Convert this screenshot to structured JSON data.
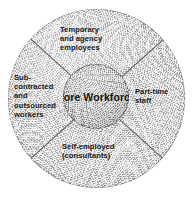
{
  "diagram": {
    "type": "core-periphery-workforce-donut",
    "title": "Core Workforce",
    "core": {
      "name": "core-circle",
      "lines": [
        "Core",
        "Workforce"
      ],
      "fill_color": "#c4c4c4",
      "border_color": "#2d2d2d"
    },
    "ring": {
      "fill_color": "#d6d6d6",
      "border_color": "#3c3c3c",
      "divider_color": "#373737",
      "divider_count": 4
    },
    "background_color": "#ffffff",
    "text_color": "#1a1a1a",
    "segments": [
      {
        "id": "temporary-and-agency-employees",
        "position": "top",
        "lines": [
          "Temporary",
          "and agency",
          "employees"
        ]
      },
      {
        "id": "sub-contracted-and-outsourced-workers",
        "position": "left",
        "lines": [
          "Sub-",
          "contracted",
          "and",
          "outsourced",
          "workers"
        ]
      },
      {
        "id": "part-time-staff",
        "position": "right",
        "lines": [
          "Part-time",
          "staff"
        ]
      },
      {
        "id": "self-employed-consultants",
        "position": "bottom",
        "lines": [
          "Self-employed",
          "(consultants)"
        ]
      }
    ]
  }
}
